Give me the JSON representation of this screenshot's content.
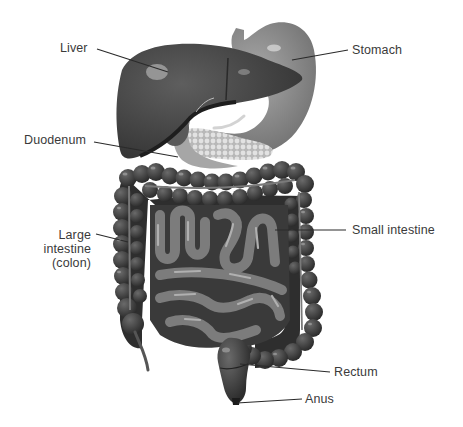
{
  "diagram": {
    "style": "grayscale illustration",
    "labels": [
      {
        "id": "liver",
        "text": "Liver"
      },
      {
        "id": "stomach",
        "text": "Stomach"
      },
      {
        "id": "duodenum",
        "text": "Duodenum"
      },
      {
        "id": "large_intestine",
        "lines": [
          "Large",
          "intestine",
          "(colon)"
        ]
      },
      {
        "id": "small_intestine",
        "text": "Small intestine"
      },
      {
        "id": "rectum",
        "text": "Rectum"
      },
      {
        "id": "anus",
        "text": "Anus"
      }
    ],
    "colors": {
      "background": "#ffffff",
      "label_text": "#3a3a3a",
      "leader_line": "#2a2a2a",
      "liver": "#4a4a4a",
      "stomach": "#8a8a8a",
      "colon": "#3e3e3e",
      "small_intestine": "#7a7a7a",
      "pancreas": "#c8c8c8"
    }
  }
}
